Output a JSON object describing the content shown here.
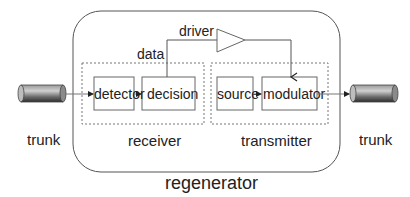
{
  "diagram": {
    "title": "regenerator",
    "colors": {
      "stroke": "#555555",
      "dashed": "#777777",
      "text": "#222222",
      "cylinder_dark": "#3a3a3a",
      "cylinder_light": "#c8c8c8"
    },
    "trunk_left": {
      "label": "trunk"
    },
    "trunk_right": {
      "label": "trunk"
    },
    "receiver": {
      "label": "receiver",
      "blocks": [
        {
          "label": "detector"
        },
        {
          "label": "decision"
        }
      ]
    },
    "transmitter": {
      "label": "transmitter",
      "blocks": [
        {
          "label": "source"
        },
        {
          "label": "modulator"
        }
      ]
    },
    "signals": {
      "data": "data",
      "driver": "driver"
    }
  }
}
